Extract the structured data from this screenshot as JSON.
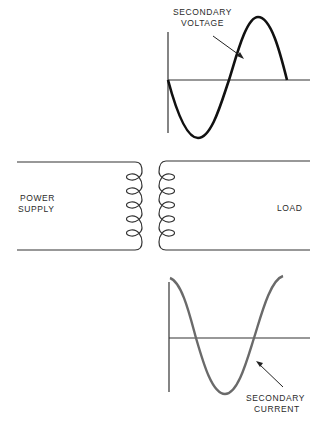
{
  "diagram": {
    "type": "transformer-waveforms",
    "labels": {
      "voltage_line1": "SECONDARY",
      "voltage_line2": "VOLTAGE",
      "current_line1": "SECONDARY",
      "current_line2": "CURRENT",
      "primary_line1": "POWER",
      "primary_line2": "SUPPLY",
      "load": "LOAD"
    },
    "colors": {
      "voltage_curve": "#111111",
      "current_curve": "#6a6a6a",
      "axes": "#333333",
      "wires": "#333333"
    },
    "primary_coil_turns": 5,
    "secondary_coil_turns": 5
  }
}
